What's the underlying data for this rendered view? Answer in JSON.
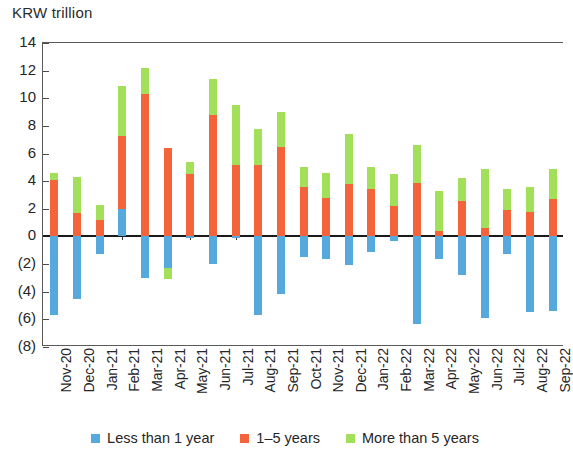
{
  "header": {
    "axis_title": "KRW trillion"
  },
  "legend": {
    "position": "bottom-center",
    "items": [
      {
        "label": "Less than 1 year",
        "color": "#55a9dd",
        "key": "short"
      },
      {
        "label": "1–5 years",
        "color": "#f4633a",
        "key": "mid"
      },
      {
        "label": "More than 5 years",
        "color": "#a2e05a",
        "key": "long"
      }
    ]
  },
  "chart_data": {
    "type": "bar",
    "stacked": true,
    "title": "KRW trillion",
    "xlabel": "",
    "ylabel": "KRW trillion",
    "ylim": [
      -8,
      14
    ],
    "ytick_values": [
      14,
      12,
      10,
      8,
      6,
      4,
      2,
      0,
      -2,
      -4,
      -6,
      -8
    ],
    "ytick_labels": [
      "14",
      "12",
      "10",
      "8",
      "6",
      "4",
      "2",
      "0",
      "(2)",
      "(4)",
      "(6)",
      "(8)"
    ],
    "grid": false,
    "categories": [
      "Nov-20",
      "Dec-20",
      "Jan-21",
      "Feb-21",
      "Mar-21",
      "Apr-21",
      "May-21",
      "Jun-21",
      "Jul-21",
      "Aug-21",
      "Sep-21",
      "Oct-21",
      "Nov-21",
      "Dec-21",
      "Jan-22",
      "Feb-22",
      "Mar-22",
      "Apr-22",
      "May-22",
      "Jun-22",
      "Jul-22",
      "Aug-22",
      "Sep-22"
    ],
    "series": [
      {
        "name": "Less than 1 year",
        "color": "#55a9dd",
        "values": [
          -5.7,
          -4.5,
          -1.3,
          2.0,
          -3.0,
          -2.3,
          -0.1,
          -2.0,
          -0.1,
          -5.7,
          -4.2,
          -1.5,
          -1.6,
          -2.1,
          -1.1,
          -0.3,
          -6.3,
          -1.6,
          -2.8,
          -5.9,
          -1.3,
          -5.5,
          -5.4
        ]
      },
      {
        "name": "1–5 years",
        "color": "#f4633a",
        "values": [
          4.1,
          1.7,
          1.2,
          5.3,
          10.3,
          6.4,
          4.5,
          8.8,
          5.2,
          5.2,
          6.5,
          3.6,
          2.8,
          3.8,
          3.4,
          2.2,
          3.9,
          0.4,
          2.6,
          0.6,
          1.9,
          1.8,
          2.7
        ]
      },
      {
        "name": "More than 5 years",
        "color": "#a2e05a",
        "values": [
          0.5,
          2.6,
          1.1,
          3.6,
          1.9,
          0.0,
          0.9,
          2.6,
          4.3,
          2.6,
          2.5,
          1.4,
          1.8,
          3.6,
          1.6,
          2.3,
          2.7,
          2.9,
          1.6,
          4.3,
          1.5,
          1.8,
          2.2
        ]
      }
    ],
    "negative_overrides": [
      {
        "category": "Apr-21",
        "series": "More than 5 years",
        "value": -0.8
      }
    ]
  }
}
